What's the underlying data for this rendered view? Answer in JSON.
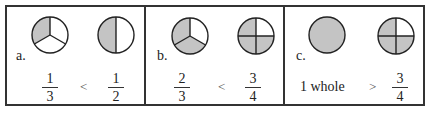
{
  "colors": {
    "shade": "#c4c4c4",
    "stroke": "#222222",
    "border": "#333333"
  },
  "panels": [
    {
      "label": "a.",
      "left": {
        "type": "fraction",
        "numerator": "1",
        "denominator": "3",
        "parts": 3,
        "shaded": 1
      },
      "operator": "<",
      "right": {
        "type": "fraction",
        "numerator": "1",
        "denominator": "2",
        "parts": 2,
        "shaded": 1
      }
    },
    {
      "label": "b.",
      "left": {
        "type": "fraction",
        "numerator": "2",
        "denominator": "3",
        "parts": 3,
        "shaded": 2
      },
      "operator": "<",
      "right": {
        "type": "fraction",
        "numerator": "3",
        "denominator": "4",
        "parts": 4,
        "shaded": 3
      }
    },
    {
      "label": "c.",
      "left": {
        "type": "whole",
        "text": "1 whole",
        "parts": 1,
        "shaded": 1
      },
      "operator": ">",
      "right": {
        "type": "fraction",
        "numerator": "3",
        "denominator": "4",
        "parts": 4,
        "shaded": 3
      }
    }
  ]
}
